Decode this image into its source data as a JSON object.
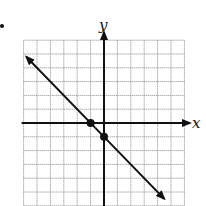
{
  "chart_data": {
    "type": "line",
    "title": "",
    "xlabel": "x",
    "ylabel": "y",
    "xlim": [
      -6,
      6
    ],
    "ylim": [
      -6,
      6
    ],
    "grid": true,
    "grid_step": 1,
    "legend": null,
    "series": [
      {
        "name": "line",
        "equation": "y = -x - 1",
        "slope": -1,
        "intercept": -1,
        "x": [
          -5.8,
          4.5
        ],
        "y": [
          4.8,
          -5.5
        ],
        "arrows": "both"
      }
    ],
    "points": [
      {
        "x": -1,
        "y": 0,
        "label": "x-intercept"
      },
      {
        "x": 0,
        "y": -1,
        "label": "y-intercept"
      }
    ]
  },
  "axes": {
    "x_label": "x",
    "y_label": "y"
  },
  "colors": {
    "axis": "#111111",
    "grid": "#9a9a9a",
    "line": "#111111"
  }
}
